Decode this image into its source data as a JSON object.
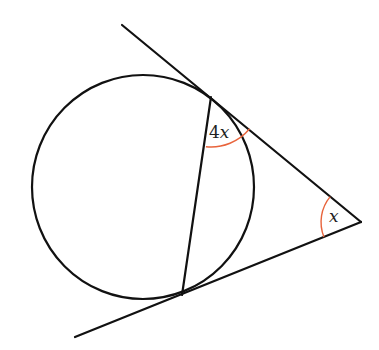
{
  "diagram": {
    "type": "circle-with-two-tangents-and-chord",
    "colors": {
      "stroke": "#111111",
      "angle_arc": "#e8643c",
      "background": "#ffffff"
    },
    "circle": {
      "cx": 143,
      "cy": 187,
      "r": 111
    },
    "external_point": {
      "x": 361,
      "y": 222
    },
    "tangent_points": {
      "upper": {
        "x": 211,
        "y": 97
      },
      "lower": {
        "x": 182,
        "y": 295
      }
    },
    "tangent_lines": {
      "upper": {
        "x1": 122,
        "y1": 25,
        "x2": 361,
        "y2": 222
      },
      "lower": {
        "x1": 75,
        "y1": 337,
        "x2": 361,
        "y2": 222
      }
    },
    "chord": {
      "x1": 211,
      "y1": 97,
      "x2": 182,
      "y2": 295
    },
    "angles": [
      {
        "id": "chord-tangent-angle",
        "coefficient": "4",
        "variable": "x",
        "label": "4x",
        "at": "upper tangent point"
      },
      {
        "id": "apex-angle",
        "coefficient": "",
        "variable": "x",
        "label": "x",
        "at": "external point"
      }
    ]
  }
}
